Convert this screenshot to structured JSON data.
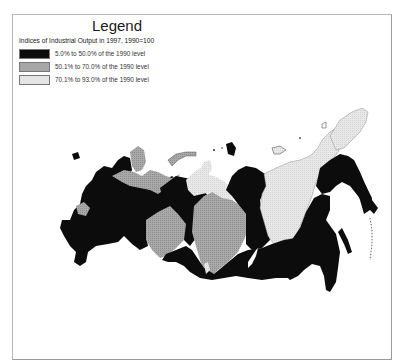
{
  "legend": {
    "title": "Legend",
    "subtitle": "Indices of Industrial Output in 1997, 1990=100",
    "items": [
      {
        "label": "5.0% to 50.0% of the 1990 level",
        "class": "low",
        "color": "#0c0c0c"
      },
      {
        "label": "50.1% to 70.0% of the 1990 level",
        "class": "mid",
        "color": "#a6a6a6"
      },
      {
        "label": "70.1% to 93.0% of the 1990 level",
        "class": "high",
        "color": "#e6e6e6"
      }
    ]
  },
  "map": {
    "subject": "Russia — regions by industrial output index 1997 (1990=100)",
    "regions_by_class": {
      "low": [
        "European Russia (central/north-west)",
        "Volga-Ural belt",
        "Krasnoyarsk / Central Siberia",
        "South Siberia",
        "Far East (Khabarovsk, Primorye, Amur)",
        "Magadan / Kamchatka",
        "Sakhalin"
      ],
      "mid": [
        "Karelia / Murmansk",
        "Arkhangelsk / Komi",
        "Middle Volga",
        "Tyumen / West Siberia",
        "Novosibirsk / Kemerovo / Tomsk"
      ],
      "high": [
        "Yamal-Nenets",
        "Sakha (Yakutia)",
        "Chukotka",
        "Altai (small)"
      ]
    }
  }
}
